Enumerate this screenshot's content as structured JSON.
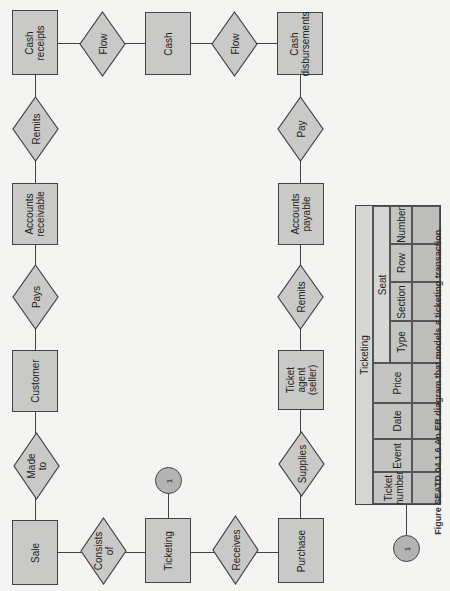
{
  "diagram": {
    "type": "entity-relationship",
    "orientation": "rotated-90-ccw",
    "entities": [
      {
        "id": "cash_receipts",
        "label": "Cash\nreceipts"
      },
      {
        "id": "cash",
        "label": "Cash"
      },
      {
        "id": "cash_disbursements",
        "label": "Cash\ndisbursements"
      },
      {
        "id": "accounts_receivable",
        "label": "Accounts\nreceivable"
      },
      {
        "id": "customer",
        "label": "Customer"
      },
      {
        "id": "sale",
        "label": "Sale"
      },
      {
        "id": "ticketing",
        "label": "Ticketing"
      },
      {
        "id": "purchase",
        "label": "Purchase"
      },
      {
        "id": "ticket_agent",
        "label": "Ticket\nagent\n(seller)"
      },
      {
        "id": "accounts_payable",
        "label": "Accounts\npayable"
      }
    ],
    "relationships": [
      {
        "id": "flow1",
        "label": "Flow",
        "from": "cash_receipts",
        "to": "cash"
      },
      {
        "id": "flow2",
        "label": "Flow",
        "from": "cash",
        "to": "cash_disbursements"
      },
      {
        "id": "remits1",
        "label": "Remits",
        "from": "accounts_receivable",
        "to": "cash_receipts"
      },
      {
        "id": "pays",
        "label": "Pays",
        "from": "customer",
        "to": "accounts_receivable"
      },
      {
        "id": "made_to",
        "label": "Made\nto",
        "from": "sale",
        "to": "customer"
      },
      {
        "id": "consists_of",
        "label": "Consists\nof",
        "from": "sale",
        "to": "ticketing"
      },
      {
        "id": "receives",
        "label": "Receives",
        "from": "ticketing",
        "to": "purchase"
      },
      {
        "id": "supplies",
        "label": "Supplies",
        "from": "ticket_agent",
        "to": "purchase"
      },
      {
        "id": "remits2",
        "label": "Remits",
        "from": "accounts_payable",
        "to": "ticket_agent"
      },
      {
        "id": "pay",
        "label": "Pay",
        "from": "cash_disbursements",
        "to": "accounts_payable"
      }
    ],
    "connectors": [
      {
        "id": "conn1_top",
        "label": "1",
        "attached_to": "ticketing"
      },
      {
        "id": "conn1_table",
        "label": "1",
        "attached_to": "ticketing_table"
      }
    ]
  },
  "table": {
    "title": "Ticketing",
    "group_header": "Seat",
    "columns": [
      "Ticket\nnumber",
      "Event",
      "Date",
      "Price",
      "Type",
      "Section",
      "Row",
      "Number"
    ]
  },
  "caption": "Figure SEATD.04.1.6  An ER diagram that models a ticketing transaction."
}
